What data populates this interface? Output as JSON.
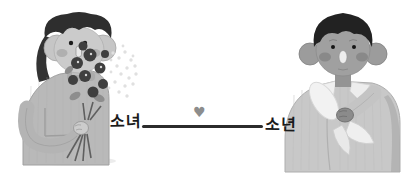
{
  "illustration": {
    "left_label": "소녀",
    "right_label": "소년",
    "heart_symbol": "♥",
    "connector": {
      "line_color": "#2b2b2b",
      "heart_color": "#8d8d8d"
    },
    "palette": {
      "background": "#ffffff",
      "girl_hair": "#2e2e2e",
      "girl_skin": "#cbcbcb",
      "girl_cheeks": "#a9a9a9",
      "girl_sweater": "#b9b9b9",
      "flowers_dark": "#3f3f3f",
      "flowers_light": "#e0e0e0",
      "stems": "#5f5f5f",
      "boy_hair": "#1f1f1f",
      "boy_skin": "#a0a0a0",
      "boy_cheeks": "#7f7f7f",
      "boy_jacket": "#c8c8c8",
      "collar_white": "#f0f0f0",
      "wrapped_bouquet": "#efefef",
      "label_color": "#1b1b1b"
    }
  }
}
